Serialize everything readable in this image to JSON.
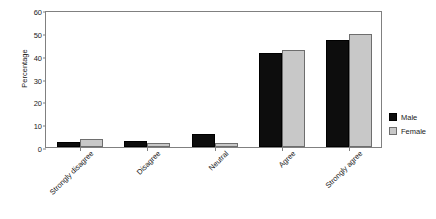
{
  "chart_data": {
    "type": "bar",
    "title": "",
    "xlabel": "",
    "ylabel": "Percentage",
    "ylim": [
      0,
      60
    ],
    "ytick_step": 10,
    "yticks": [
      0,
      10,
      20,
      30,
      40,
      50,
      60
    ],
    "grid": false,
    "legend_position": "right",
    "categories": [
      "Strongly disagree",
      "Disagree",
      "Neutral",
      "Agree",
      "Strongly agree"
    ],
    "series": [
      {
        "name": "Male",
        "color": "#0d0d0d",
        "values": [
          2.2,
          2.5,
          5.5,
          41.0,
          46.8
        ]
      },
      {
        "name": "Female",
        "color": "#c8c8c8",
        "values": [
          3.5,
          1.7,
          1.7,
          42.6,
          49.5
        ]
      }
    ]
  },
  "figure": {
    "caption_remnant": ""
  }
}
